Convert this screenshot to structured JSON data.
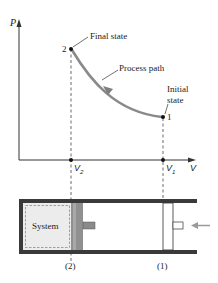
{
  "diagram": {
    "type": "P-V process diagram with piston-cylinder device",
    "axes": {
      "y_label": "P",
      "x_label": "V"
    },
    "states": [
      {
        "id": "2",
        "label": "2",
        "annotation": "Final state",
        "volume_label": "V",
        "volume_subscript": "2"
      },
      {
        "id": "1",
        "label": "1",
        "annotation_line1": "Initial",
        "annotation_line2": "state",
        "volume_label": "V",
        "volume_subscript": "1"
      }
    ],
    "process_label": "Process path",
    "piston_cylinder": {
      "system_label": "System",
      "position_2_label": "(2)",
      "position_1_label": "(1)"
    },
    "colors": {
      "curve": "#8a8a8a",
      "axis": "#333333",
      "cylinder_wall": "#3a3a3a",
      "piston": "#8f8f8f",
      "system_fill": "#ececec",
      "push_arrow": "#9a9a9a"
    }
  }
}
